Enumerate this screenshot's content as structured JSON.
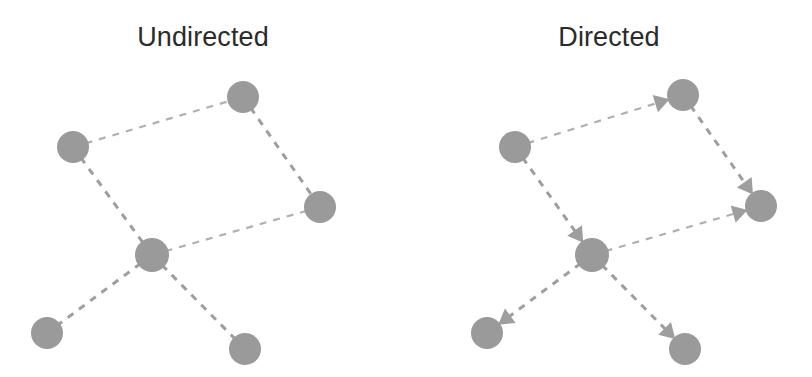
{
  "figure": {
    "width": 812,
    "height": 377,
    "background": "#ffffff",
    "caption_font_size": 27,
    "title_color": "#2b2b2b"
  },
  "style": {
    "node_fill": "#9a9a9a",
    "edge_color": "#9e9e9e",
    "edge_color_light": "#b0b0b0",
    "edge_width": 3,
    "edge_width_thin": 2.2,
    "edge_dash": "7 7",
    "node_radius": 16,
    "node_radius_center": 17,
    "arrow_length": 15,
    "arrow_half_width": 9
  },
  "panels": [
    {
      "id": "undirected",
      "title": "Undirected",
      "origin_x": 0,
      "directed": false,
      "nodes": [
        {
          "id": "top",
          "name": "node-top",
          "x": 243,
          "y": 97,
          "r": 16
        },
        {
          "id": "left",
          "name": "node-left",
          "x": 73,
          "y": 147,
          "r": 16
        },
        {
          "id": "right",
          "name": "node-right",
          "x": 320,
          "y": 207,
          "r": 16
        },
        {
          "id": "center",
          "name": "node-center",
          "x": 152,
          "y": 255,
          "r": 17
        },
        {
          "id": "bottom_left",
          "name": "node-bottom-left",
          "x": 47,
          "y": 333,
          "r": 16
        },
        {
          "id": "bottom_right",
          "name": "node-bottom-right",
          "x": 245,
          "y": 349,
          "r": 16
        }
      ],
      "edges": [
        {
          "name": "edge-left-top",
          "from": "left",
          "to": "top",
          "thin": true
        },
        {
          "name": "edge-top-right",
          "from": "top",
          "to": "right",
          "thin": false
        },
        {
          "name": "edge-left-center",
          "from": "left",
          "to": "center",
          "thin": false
        },
        {
          "name": "edge-center-right",
          "from": "center",
          "to": "right",
          "thin": true
        },
        {
          "name": "edge-center-bottom-left",
          "from": "center",
          "to": "bottom_left",
          "thin": false
        },
        {
          "name": "edge-center-bottom-right",
          "from": "center",
          "to": "bottom_right",
          "thin": false
        }
      ]
    },
    {
      "id": "directed",
      "title": "Directed",
      "origin_x": 406,
      "directed": true,
      "nodes": [
        {
          "id": "top",
          "name": "node-top",
          "x": 277,
          "y": 95,
          "r": 16
        },
        {
          "id": "left",
          "name": "node-left",
          "x": 109,
          "y": 147,
          "r": 16
        },
        {
          "id": "right",
          "name": "node-right",
          "x": 355,
          "y": 206,
          "r": 16
        },
        {
          "id": "center",
          "name": "node-center",
          "x": 186,
          "y": 255,
          "r": 17
        },
        {
          "id": "bottom_left",
          "name": "node-bottom-left",
          "x": 81,
          "y": 333,
          "r": 16
        },
        {
          "id": "bottom_right",
          "name": "node-bottom-right",
          "x": 279,
          "y": 349,
          "r": 16
        }
      ],
      "edges": [
        {
          "name": "edge-left-to-top",
          "from": "left",
          "to": "top",
          "thin": true,
          "arrow": true
        },
        {
          "name": "edge-top-to-right",
          "from": "top",
          "to": "right",
          "thin": false,
          "arrow": true
        },
        {
          "name": "edge-left-to-center",
          "from": "left",
          "to": "center",
          "thin": false,
          "arrow": true
        },
        {
          "name": "edge-center-to-right",
          "from": "center",
          "to": "right",
          "thin": true,
          "arrow": true
        },
        {
          "name": "edge-center-to-bottom-left",
          "from": "center",
          "to": "bottom_left",
          "thin": false,
          "arrow": true
        },
        {
          "name": "edge-center-to-bottom-right",
          "from": "center",
          "to": "bottom_right",
          "thin": false,
          "arrow": true
        }
      ]
    }
  ]
}
